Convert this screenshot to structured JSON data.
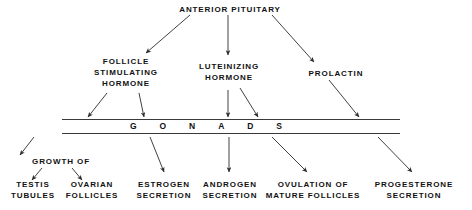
{
  "diagram": {
    "title": "ANTERIOR PITUITARY",
    "type": "flow-diagram",
    "background_color": "#ffffff",
    "line_color": "#3a3a3a",
    "text_color": "#111111",
    "root": {
      "label": "ANTERIOR PITUITARY"
    },
    "hormones": [
      {
        "id": "fsh",
        "label": "FOLLICLE\nSTIMULATING\nHORMONE"
      },
      {
        "id": "lh",
        "label": "LUTEINIZING\nHORMONE"
      },
      {
        "id": "prolactin",
        "label": "PROLACTIN"
      }
    ],
    "target_organ": {
      "label": "GONADS",
      "letters": [
        "G",
        "O",
        "N",
        "A",
        "D",
        "S"
      ]
    },
    "effects": [
      {
        "id": "growth-of",
        "label": "GROWTH OF"
      },
      {
        "id": "testis-tubules",
        "label": "TESTIS\nTUBULES"
      },
      {
        "id": "ovarian-follicles",
        "label": "OVARIAN\nFOLLICLES"
      },
      {
        "id": "estrogen-secretion",
        "label": "ESTROGEN\nSECRETION"
      },
      {
        "id": "androgen-secretion",
        "label": "ANDROGEN\nSECRETION"
      },
      {
        "id": "ovulation-mature-follicles",
        "label": "OVULATION OF\nMATURE FOLLICLES"
      },
      {
        "id": "progesterone-secretion",
        "label": "PROGESTERONE\nSECRETION"
      }
    ]
  },
  "chart_data": {
    "type": "diagram",
    "title": "ANTERIOR PITUITARY",
    "nodes": [
      "ANTERIOR PITUITARY",
      "FOLLICLE STIMULATING HORMONE",
      "LUTEINIZING HORMONE",
      "PROLACTIN",
      "GONADS",
      "GROWTH OF",
      "TESTIS TUBULES",
      "OVARIAN FOLLICLES",
      "ESTROGEN SECRETION",
      "ANDROGEN SECRETION",
      "OVULATION OF MATURE FOLLICLES",
      "PROGESTERONE SECRETION"
    ],
    "edges": [
      [
        "ANTERIOR PITUITARY",
        "FOLLICLE STIMULATING HORMONE"
      ],
      [
        "ANTERIOR PITUITARY",
        "LUTEINIZING HORMONE"
      ],
      [
        "ANTERIOR PITUITARY",
        "PROLACTIN"
      ],
      [
        "FOLLICLE STIMULATING HORMONE",
        "GONADS"
      ],
      [
        "LUTEINIZING HORMONE",
        "GONADS"
      ],
      [
        "PROLACTIN",
        "GONADS"
      ],
      [
        "GONADS",
        "GROWTH OF"
      ],
      [
        "GROWTH OF",
        "TESTIS TUBULES"
      ],
      [
        "GROWTH OF",
        "OVARIAN FOLLICLES"
      ],
      [
        "GONADS",
        "ESTROGEN SECRETION"
      ],
      [
        "GONADS",
        "ANDROGEN SECRETION"
      ],
      [
        "GONADS",
        "OVULATION OF MATURE FOLLICLES"
      ],
      [
        "GONADS",
        "PROGESTERONE SECRETION"
      ]
    ]
  }
}
